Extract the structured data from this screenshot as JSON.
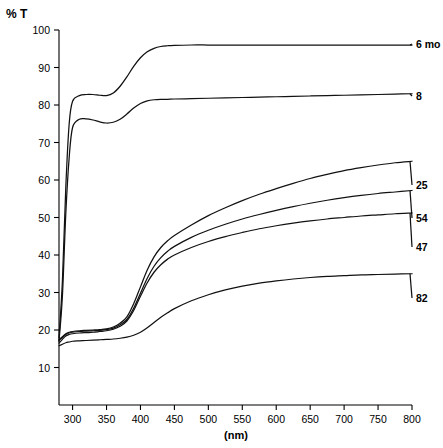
{
  "chart_data": {
    "type": "line",
    "title": "",
    "xlabel": "(nm)",
    "ylabel": "% T",
    "xlim": [
      280,
      800
    ],
    "ylim": [
      0,
      100
    ],
    "xticks": [
      300,
      350,
      400,
      450,
      500,
      550,
      600,
      650,
      700,
      750,
      800
    ],
    "yticks": [
      10,
      20,
      30,
      40,
      50,
      60,
      70,
      80,
      90,
      100
    ],
    "grid": false,
    "legend_position": "right-inline-labels",
    "x": [
      280,
      285,
      290,
      295,
      300,
      310,
      320,
      330,
      340,
      350,
      360,
      370,
      380,
      390,
      400,
      410,
      420,
      430,
      440,
      450,
      475,
      500,
      525,
      550,
      575,
      600,
      625,
      650,
      675,
      700,
      725,
      750,
      775,
      800
    ],
    "series": [
      {
        "name": "6 mo",
        "label": "6 mo",
        "values": [
          18,
          33,
          58,
          75,
          81,
          82.5,
          82.8,
          82.8,
          82.6,
          82.5,
          83.2,
          85.0,
          87.5,
          90.3,
          92.6,
          94.2,
          95.1,
          95.6,
          95.8,
          95.9,
          96.0,
          96.0,
          96.0,
          96.0,
          96.0,
          96.0,
          96.0,
          96.0,
          96.0,
          96.0,
          96.0,
          96.0,
          96.0,
          96.0
        ]
      },
      {
        "name": "8",
        "label": "8",
        "values": [
          17,
          29,
          51,
          66,
          74,
          76.2,
          76.3,
          76.0,
          75.5,
          75.2,
          75.4,
          76.2,
          77.6,
          79.2,
          80.4,
          81.1,
          81.4,
          81.5,
          81.5,
          81.6,
          81.7,
          81.8,
          81.9,
          82.0,
          82.1,
          82.2,
          82.3,
          82.4,
          82.5,
          82.6,
          82.7,
          82.8,
          82.9,
          83.0
        ]
      },
      {
        "name": "25",
        "label": "25",
        "values": [
          17.5,
          18.2,
          19.0,
          19.4,
          19.6,
          19.8,
          19.9,
          20.0,
          20.1,
          20.3,
          20.8,
          21.8,
          23.5,
          27.0,
          31.5,
          36.0,
          39.5,
          42.0,
          43.8,
          45.2,
          48.0,
          50.5,
          52.6,
          54.5,
          56.2,
          57.7,
          59.1,
          60.4,
          61.5,
          62.5,
          63.3,
          64.0,
          64.6,
          65.0
        ]
      },
      {
        "name": "54",
        "label": "54",
        "values": [
          17.2,
          18.0,
          18.8,
          19.2,
          19.4,
          19.6,
          19.7,
          19.8,
          19.9,
          20.1,
          20.5,
          21.4,
          22.8,
          25.8,
          29.8,
          33.8,
          37.0,
          39.3,
          41.0,
          42.3,
          44.7,
          46.6,
          48.2,
          49.6,
          50.8,
          51.9,
          52.9,
          53.8,
          54.6,
          55.3,
          55.9,
          56.4,
          56.8,
          57.2
        ]
      },
      {
        "name": "47",
        "label": "47",
        "values": [
          16.5,
          17.5,
          18.4,
          18.8,
          19.0,
          19.2,
          19.3,
          19.4,
          19.6,
          19.8,
          20.2,
          21.0,
          22.4,
          25.2,
          29.0,
          32.6,
          35.4,
          37.4,
          38.9,
          40.0,
          42.0,
          43.6,
          44.9,
          46.0,
          47.0,
          47.8,
          48.5,
          49.1,
          49.6,
          50.0,
          50.4,
          50.7,
          51.0,
          51.2
        ]
      },
      {
        "name": "82",
        "label": "82",
        "values": [
          15.8,
          16.2,
          16.6,
          16.8,
          17.0,
          17.1,
          17.2,
          17.3,
          17.4,
          17.5,
          17.6,
          17.8,
          18.1,
          18.6,
          19.4,
          20.6,
          22.0,
          23.4,
          24.6,
          25.7,
          27.8,
          29.4,
          30.7,
          31.7,
          32.5,
          33.1,
          33.6,
          34.0,
          34.3,
          34.5,
          34.7,
          34.8,
          34.9,
          35.0
        ]
      }
    ]
  },
  "axes": {
    "y_axis_caption": "% T",
    "x_axis_caption": "(nm)",
    "y_tick_labels": [
      "100",
      "90",
      "80",
      "70",
      "60",
      "50",
      "40",
      "30",
      "20",
      "10"
    ],
    "x_tick_labels": [
      "300",
      "350",
      "400",
      "450",
      "500",
      "550",
      "600",
      "650",
      "700",
      "750",
      "800"
    ]
  },
  "series_labels": [
    {
      "text": "6 mo",
      "value": 96.0
    },
    {
      "text": "8",
      "value": 83.0
    },
    {
      "text": "25",
      "value": 65.0
    },
    {
      "text": "54",
      "value": 57.2
    },
    {
      "text": "47",
      "value": 51.2
    },
    {
      "text": "82",
      "value": 35.0
    }
  ]
}
